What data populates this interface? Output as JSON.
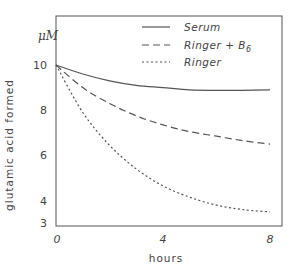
{
  "chart_data": {
    "type": "line",
    "title": "",
    "xlabel": "hours",
    "ylabel": "glutamic acid formed",
    "yunit": "μM",
    "xlim": [
      0,
      8
    ],
    "ylim": [
      3,
      12.1
    ],
    "xticks": [
      0,
      4,
      8
    ],
    "xtick_labels": [
      "0",
      "4",
      "8"
    ],
    "yticks": [
      3,
      4,
      6,
      8,
      10
    ],
    "ytick_labels": [
      "3",
      "4",
      "6",
      "8",
      "10"
    ],
    "grid": false,
    "legend_position": "upper right",
    "x": [
      0,
      1,
      2,
      3,
      4,
      5,
      6,
      7,
      8
    ],
    "series": [
      {
        "name": "Serum",
        "style": "solid",
        "values": [
          10.0,
          9.6,
          9.3,
          9.1,
          9.0,
          8.9,
          8.88,
          8.88,
          8.9
        ]
      },
      {
        "name": "Ringer + B6",
        "style": "dashed",
        "values": [
          10.0,
          9.0,
          8.3,
          7.75,
          7.35,
          7.05,
          6.85,
          6.65,
          6.5
        ]
      },
      {
        "name": "Ringer",
        "style": "dotted",
        "values": [
          10.0,
          7.9,
          6.45,
          5.4,
          4.65,
          4.15,
          3.8,
          3.6,
          3.5
        ]
      }
    ]
  },
  "legend": {
    "items": [
      {
        "label": "Serum",
        "sub": ""
      },
      {
        "label": "Ringer + B",
        "sub": "6"
      },
      {
        "label": "Ringer",
        "sub": ""
      }
    ]
  },
  "axes": {
    "x_title": "hours",
    "y_title": "glutamic acid formed",
    "y_unit": "μM"
  }
}
